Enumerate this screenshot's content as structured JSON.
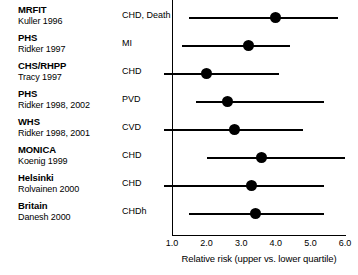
{
  "chart_data": {
    "type": "scatter",
    "subtype": "forest-plot",
    "title": "",
    "xlabel": "Relative risk (upper vs. lower quartile)",
    "ylabel": "",
    "xlim": [
      1.0,
      6.0
    ],
    "xticks": [
      "1.0",
      "2.0",
      "3.0",
      "4.0",
      "5.0",
      "6.0"
    ],
    "xtick_values": [
      1.0,
      2.0,
      3.0,
      4.0,
      5.0,
      6.0
    ],
    "grid": false,
    "legend": "none",
    "columns": [
      "Study",
      "Reference",
      "Outcome",
      "Relative risk",
      "CI low",
      "CI high"
    ],
    "rows": [
      {
        "study": "MRFIT",
        "reference": "Kuller 1996",
        "outcome": "CHD, Death",
        "estimate": 4.0,
        "ci_low": 1.5,
        "ci_high": 5.8,
        "ci_low_clipped": false
      },
      {
        "study": "PHS",
        "reference": "Ridker 1997",
        "outcome": "MI",
        "estimate": 3.2,
        "ci_low": 1.3,
        "ci_high": 4.4,
        "ci_low_clipped": false
      },
      {
        "study": "CHS/RHPP",
        "reference": "Tracy 1997",
        "outcome": "CHD",
        "estimate": 2.0,
        "ci_low": 0.8,
        "ci_high": 4.1,
        "ci_low_clipped": true
      },
      {
        "study": "PHS",
        "reference": "Ridker 1998, 2002",
        "outcome": "PVD",
        "estimate": 2.6,
        "ci_low": 1.7,
        "ci_high": 5.4,
        "ci_low_clipped": false
      },
      {
        "study": "WHS",
        "reference": "Ridker 1998, 2001",
        "outcome": "CVD",
        "estimate": 2.8,
        "ci_low": 0.8,
        "ci_high": 4.8,
        "ci_low_clipped": true
      },
      {
        "study": "MONICA",
        "reference": "Koenig 1999",
        "outcome": "CHD",
        "estimate": 3.6,
        "ci_low": 2.0,
        "ci_high": 6.0,
        "ci_low_clipped": false
      },
      {
        "study": "Helsinki",
        "reference": "Rolvainen 2000",
        "outcome": "CHD",
        "estimate": 3.3,
        "ci_low": 0.8,
        "ci_high": 5.4,
        "ci_low_clipped": true
      },
      {
        "study": "Britain",
        "reference": "Danesh 2000",
        "outcome": "CHDh",
        "estimate": 3.4,
        "ci_low": 1.5,
        "ci_high": 5.4,
        "ci_low_clipped": false
      }
    ]
  },
  "colors": {
    "marker": "#000000",
    "line": "#000000",
    "axis": "#000000",
    "background": "#ffffff"
  }
}
